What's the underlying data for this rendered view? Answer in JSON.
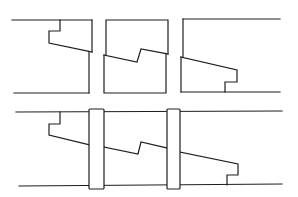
{
  "diagram": {
    "stroke_color": "#1e1e1e",
    "background": "#ffffff",
    "top_row": {
      "left_piece": {
        "top_edge": [
          [
            12,
            20
          ],
          [
            92,
            20
          ]
        ],
        "bottom_edge": [
          [
            14,
            93
          ],
          [
            89,
            93
          ]
        ],
        "joint_profile": [
          [
            60,
            20
          ],
          [
            60,
            31
          ],
          [
            49,
            31
          ],
          [
            49,
            43
          ],
          [
            92,
            52
          ]
        ],
        "right_upper": [
          [
            92,
            20
          ],
          [
            92,
            52
          ]
        ],
        "right_lower": [
          [
            89,
            52
          ],
          [
            89,
            93
          ]
        ]
      },
      "middle_piece": {
        "upper_outline": [
          [
            106,
            55
          ],
          [
            106,
            20
          ],
          [
            168,
            20
          ],
          [
            168,
            54
          ]
        ],
        "step_profile": [
          [
            104,
            55
          ],
          [
            137,
            62
          ],
          [
            141,
            49
          ],
          [
            168,
            54
          ]
        ],
        "lower_outline": [
          [
            104,
            55
          ],
          [
            104,
            93
          ],
          [
            166,
            93
          ],
          [
            166,
            54
          ]
        ]
      },
      "right_piece": {
        "top_edge": [
          [
            183,
            19
          ],
          [
            280,
            19
          ]
        ],
        "left_upper": [
          [
            183,
            19
          ],
          [
            183,
            57
          ]
        ],
        "joint_profile": [
          [
            181,
            57
          ],
          [
            237,
            70
          ],
          [
            237,
            82
          ],
          [
            225,
            82
          ],
          [
            225,
            92
          ]
        ],
        "left_lower": [
          [
            181,
            57
          ],
          [
            181,
            92
          ]
        ],
        "bottom_edge": [
          [
            181,
            92
          ],
          [
            280,
            92
          ]
        ]
      }
    },
    "bottom_row": {
      "top_edge": [
        [
          16,
          112
        ],
        [
          282,
          111
        ]
      ],
      "bottom_edge": [
        [
          19,
          186
        ],
        [
          282,
          184
        ]
      ],
      "left_notch": [
        [
          60,
          112
        ],
        [
          60,
          124
        ],
        [
          49,
          124
        ],
        [
          49,
          135
        ],
        [
          90,
          145
        ]
      ],
      "middle_step": [
        [
          104,
          147
        ],
        [
          138,
          154
        ],
        [
          141,
          142
        ],
        [
          167,
          148
        ]
      ],
      "right_notch": [
        [
          180,
          152
        ],
        [
          238,
          164
        ],
        [
          238,
          175
        ],
        [
          227,
          175
        ],
        [
          227,
          185
        ]
      ],
      "collars": [
        {
          "x": 89,
          "y": 109,
          "width": 15,
          "height": 80
        },
        {
          "x": 167,
          "y": 109,
          "width": 13,
          "height": 80
        }
      ]
    }
  }
}
